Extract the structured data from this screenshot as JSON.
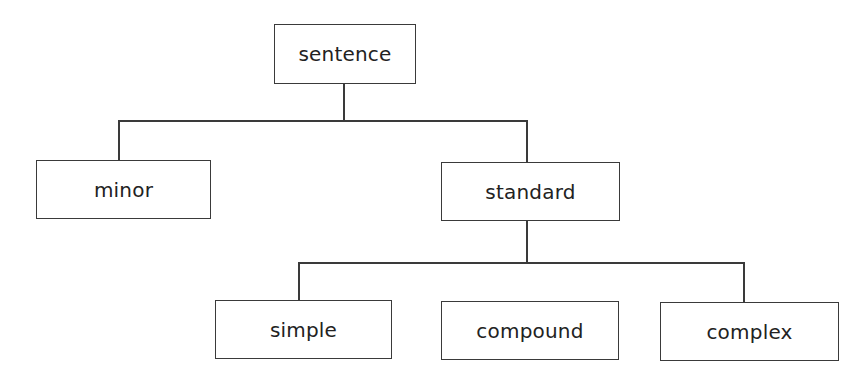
{
  "diagram": {
    "type": "tree",
    "root": {
      "label": "sentence",
      "children": [
        {
          "label": "minor",
          "children": []
        },
        {
          "label": "standard",
          "children": [
            {
              "label": "simple",
              "children": []
            },
            {
              "label": "compound",
              "children": []
            },
            {
              "label": "complex",
              "children": []
            }
          ]
        }
      ]
    },
    "nodes": {
      "sentence": "sentence",
      "minor": "minor",
      "standard": "standard",
      "simple": "simple",
      "compound": "compound",
      "complex": "complex"
    },
    "colors": {
      "stroke": "#3a3a3a",
      "text": "#222222",
      "background": "#ffffff"
    }
  }
}
